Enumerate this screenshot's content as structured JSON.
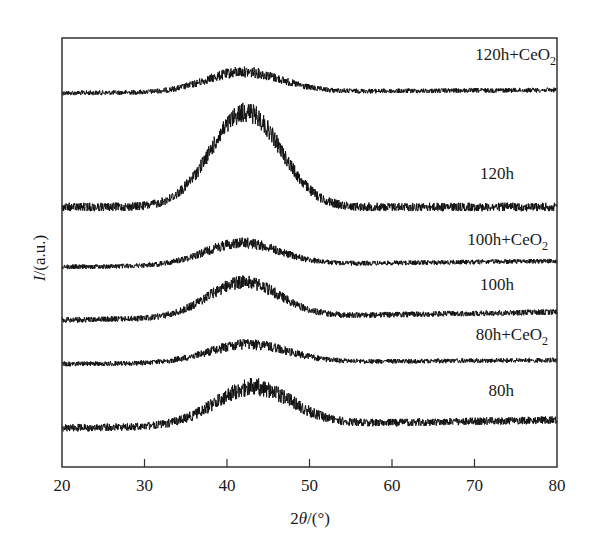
{
  "chart_data": {
    "type": "line",
    "title": "",
    "xlabel": "2θ/(°)",
    "ylabel": "I/(a.u.)",
    "xlim": [
      20,
      80
    ],
    "xticks": [
      20,
      30,
      40,
      50,
      60,
      70,
      80
    ],
    "xtick_labels": [
      "20",
      "30",
      "40",
      "50",
      "60",
      "70",
      "80"
    ],
    "yticks": [],
    "grid": false,
    "legend": "inline labels at right of each trace",
    "series": [
      {
        "name": "120h+CeO2",
        "label_main": "120h+CeO",
        "label_sub": "2",
        "baseline_px": 93,
        "peak_center_deg": 42,
        "peak_height_px": 20,
        "peak_width_deg": 4.5,
        "right_rise_px": 3,
        "noise_px": 5,
        "label_x": 556,
        "label_y": 60
      },
      {
        "name": "120h",
        "label_main": "120h",
        "label_sub": "",
        "baseline_px": 207,
        "peak_center_deg": 42.3,
        "peak_height_px": 95,
        "peak_width_deg": 4.2,
        "right_rise_px": 0,
        "noise_px": 9,
        "label_x": 514,
        "label_y": 179
      },
      {
        "name": "100h+CeO2",
        "label_main": "100h+CeO",
        "label_sub": "2",
        "baseline_px": 267,
        "peak_center_deg": 41.8,
        "peak_height_px": 22,
        "peak_width_deg": 4.5,
        "right_rise_px": 6,
        "noise_px": 5,
        "label_x": 548,
        "label_y": 245
      },
      {
        "name": "100h",
        "label_main": "100h",
        "label_sub": "",
        "baseline_px": 320,
        "peak_center_deg": 42,
        "peak_height_px": 35,
        "peak_width_deg": 4.3,
        "right_rise_px": 8,
        "noise_px": 6,
        "label_x": 514,
        "label_y": 290
      },
      {
        "name": "80h+CeO2",
        "label_main": "80h+CeO",
        "label_sub": "2",
        "baseline_px": 364,
        "peak_center_deg": 42.5,
        "peak_height_px": 18,
        "peak_width_deg": 4.8,
        "right_rise_px": 4,
        "noise_px": 5,
        "label_x": 548,
        "label_y": 340
      },
      {
        "name": "80h",
        "label_main": "80h",
        "label_sub": "",
        "baseline_px": 428,
        "peak_center_deg": 43.2,
        "peak_height_px": 38,
        "peak_width_deg": 4.6,
        "right_rise_px": 8,
        "noise_px": 8,
        "label_x": 514,
        "label_y": 396
      }
    ]
  },
  "frame": {
    "left_px": 62,
    "top_px": 38,
    "right_px": 557,
    "bottom_px": 467
  },
  "colors": {
    "trace": "#111111",
    "axis": "#333333",
    "background": "#ffffff"
  }
}
